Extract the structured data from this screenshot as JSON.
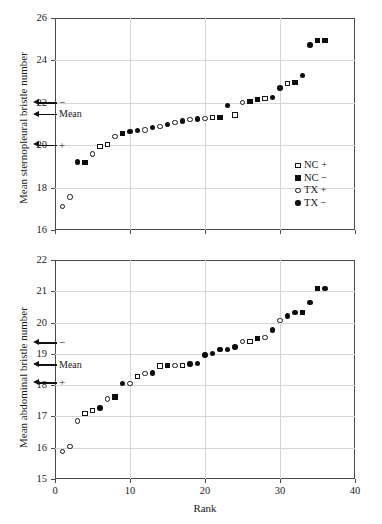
{
  "figure": {
    "background": "#ffffff",
    "marker_color": "#0d0d0d",
    "grid_color": "#d6d6d6",
    "frame_color": "#4a4a4a"
  },
  "legend": {
    "position": "inside-bottom-right-of-top-panel",
    "entries": [
      {
        "label": "NC +",
        "marker": "square-open",
        "series": "NC+"
      },
      {
        "label": "NC −",
        "marker": "square-filled",
        "series": "NC-"
      },
      {
        "label": "TX +",
        "marker": "circle-open",
        "series": "TX+"
      },
      {
        "label": "TX −",
        "marker": "circle-filled",
        "series": "TX-"
      }
    ]
  },
  "chart_data": [
    {
      "id": "sternopleural",
      "type": "scatter",
      "title": "",
      "xlabel": "",
      "ylabel": "Mean sternopleural bristle number",
      "xlim": [
        0,
        40
      ],
      "ylim": [
        16,
        26
      ],
      "xticks": [
        0,
        10,
        20,
        30,
        40
      ],
      "yticks": [
        16,
        18,
        20,
        22,
        24,
        26
      ],
      "xtick_labels": [
        "",
        "",
        "",
        "",
        ""
      ],
      "ytick_labels": [
        "16",
        "18",
        "20",
        "22",
        "24",
        "26"
      ],
      "grid": "both",
      "annotations": [
        {
          "label": "−",
          "y": 22.0,
          "kind": "arrow-left"
        },
        {
          "label": "Mean",
          "y": 21.45,
          "kind": "arrow-left"
        },
        {
          "label": "+",
          "y": 20.0,
          "kind": "arrow-left"
        }
      ],
      "series": [
        {
          "name": "TX +",
          "marker": "circle-open",
          "points": [
            {
              "x": 1,
              "y": 17.1
            },
            {
              "x": 2,
              "y": 17.56
            },
            {
              "x": 5,
              "y": 19.58
            },
            {
              "x": 8,
              "y": 20.41
            },
            {
              "x": 12,
              "y": 20.72
            },
            {
              "x": 14,
              "y": 20.88
            },
            {
              "x": 16,
              "y": 21.06
            },
            {
              "x": 18,
              "y": 21.22
            },
            {
              "x": 20,
              "y": 21.26
            },
            {
              "x": 25,
              "y": 22.0
            }
          ]
        },
        {
          "name": "TX −",
          "marker": "circle-filled",
          "points": [
            {
              "x": 3,
              "y": 19.2
            },
            {
              "x": 10,
              "y": 20.65
            },
            {
              "x": 11,
              "y": 20.7
            },
            {
              "x": 13,
              "y": 20.84
            },
            {
              "x": 15,
              "y": 20.97
            },
            {
              "x": 17,
              "y": 21.14
            },
            {
              "x": 19,
              "y": 21.24
            },
            {
              "x": 23,
              "y": 21.86
            },
            {
              "x": 29,
              "y": 22.24
            },
            {
              "x": 30,
              "y": 22.69
            },
            {
              "x": 33,
              "y": 23.29
            },
            {
              "x": 34,
              "y": 24.72
            }
          ]
        },
        {
          "name": "NC +",
          "marker": "square-open",
          "points": [
            {
              "x": 6,
              "y": 19.93
            },
            {
              "x": 7,
              "y": 20.03
            },
            {
              "x": 21,
              "y": 21.3
            },
            {
              "x": 24,
              "y": 21.42
            },
            {
              "x": 28,
              "y": 22.22
            },
            {
              "x": 31,
              "y": 22.9
            }
          ]
        },
        {
          "name": "NC −",
          "marker": "square-filled",
          "points": [
            {
              "x": 4,
              "y": 19.18
            },
            {
              "x": 9,
              "y": 20.55
            },
            {
              "x": 22,
              "y": 21.3
            },
            {
              "x": 26,
              "y": 22.08
            },
            {
              "x": 27,
              "y": 22.14
            },
            {
              "x": 32,
              "y": 22.94
            },
            {
              "x": 35,
              "y": 24.92
            },
            {
              "x": 36,
              "y": 24.92
            }
          ]
        }
      ]
    },
    {
      "id": "abdominal",
      "type": "scatter",
      "title": "",
      "xlabel": "Rank",
      "ylabel": "Mean abdominal bristle number",
      "xlim": [
        0,
        40
      ],
      "ylim": [
        15,
        22
      ],
      "xticks": [
        0,
        10,
        20,
        30,
        40
      ],
      "yticks": [
        15,
        16,
        17,
        18,
        19,
        20,
        21,
        22
      ],
      "xtick_labels": [
        "0",
        "10",
        "20",
        "30",
        "40"
      ],
      "ytick_labels": [
        "15",
        "16",
        "17",
        "18",
        "19",
        "20",
        "21",
        "22"
      ],
      "grid": "both",
      "annotations": [
        {
          "label": "−",
          "y": 19.35,
          "kind": "arrow-left"
        },
        {
          "label": "Mean",
          "y": 18.65,
          "kind": "arrow-left"
        },
        {
          "label": "+",
          "y": 18.07,
          "kind": "arrow-left"
        }
      ],
      "series": [
        {
          "name": "TX +",
          "marker": "circle-open",
          "points": [
            {
              "x": 1,
              "y": 15.88
            },
            {
              "x": 2,
              "y": 16.04
            },
            {
              "x": 3,
              "y": 16.85
            },
            {
              "x": 7,
              "y": 17.56
            },
            {
              "x": 10,
              "y": 18.05
            },
            {
              "x": 12,
              "y": 18.37
            },
            {
              "x": 16,
              "y": 18.63
            },
            {
              "x": 25,
              "y": 19.4
            },
            {
              "x": 28,
              "y": 19.53
            },
            {
              "x": 30,
              "y": 20.07
            }
          ]
        },
        {
          "name": "TX −",
          "marker": "circle-filled",
          "points": [
            {
              "x": 6,
              "y": 17.27
            },
            {
              "x": 9,
              "y": 18.06
            },
            {
              "x": 13,
              "y": 18.39
            },
            {
              "x": 18,
              "y": 18.68
            },
            {
              "x": 19,
              "y": 18.7
            },
            {
              "x": 20,
              "y": 18.96
            },
            {
              "x": 21,
              "y": 19.01
            },
            {
              "x": 22,
              "y": 19.13
            },
            {
              "x": 23,
              "y": 19.13
            },
            {
              "x": 24,
              "y": 19.22
            },
            {
              "x": 29,
              "y": 19.76
            },
            {
              "x": 31,
              "y": 20.21
            },
            {
              "x": 32,
              "y": 20.33
            },
            {
              "x": 34,
              "y": 20.65
            },
            {
              "x": 36,
              "y": 21.08
            }
          ]
        },
        {
          "name": "NC +",
          "marker": "square-open",
          "points": [
            {
              "x": 4,
              "y": 17.09
            },
            {
              "x": 5,
              "y": 17.18
            },
            {
              "x": 11,
              "y": 18.28
            },
            {
              "x": 14,
              "y": 18.61
            },
            {
              "x": 17,
              "y": 18.64
            },
            {
              "x": 26,
              "y": 19.4
            }
          ]
        },
        {
          "name": "NC −",
          "marker": "square-filled",
          "points": [
            {
              "x": 8,
              "y": 17.62
            },
            {
              "x": 15,
              "y": 18.62
            },
            {
              "x": 27,
              "y": 19.49
            },
            {
              "x": 33,
              "y": 20.33
            },
            {
              "x": 35,
              "y": 21.08
            }
          ]
        }
      ]
    }
  ]
}
